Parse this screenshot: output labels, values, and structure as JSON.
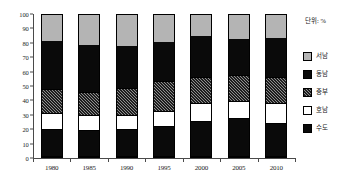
{
  "unit_note": "단위: %",
  "legend": {
    "items": [
      {
        "label": "서남",
        "swatch": "gray"
      },
      {
        "label": "동남",
        "swatch": "solid-black"
      },
      {
        "label": "중부",
        "swatch": "hatch"
      },
      {
        "label": "호남",
        "swatch": "white"
      },
      {
        "label": "수도",
        "swatch": "solid-black"
      }
    ]
  },
  "chart_data": {
    "type": "bar",
    "subtype": "stacked-100",
    "title": "",
    "xlabel": "",
    "ylabel": "",
    "ylim": [
      0,
      100
    ],
    "ytick_step": 10,
    "yticks": [
      0,
      10,
      20,
      30,
      40,
      50,
      60,
      70,
      80,
      90,
      100
    ],
    "grid": false,
    "legend_position": "right",
    "categories": [
      "1980",
      "1985",
      "1990",
      "1995",
      "2000",
      "2005",
      "2010"
    ],
    "series": [
      {
        "name": "수도",
        "swatch": "solid-black",
        "values": [
          19,
          18,
          19,
          21,
          25,
          27,
          23
        ]
      },
      {
        "name": "호남",
        "swatch": "white",
        "values": [
          11,
          11,
          10,
          11,
          12,
          12,
          14
        ]
      },
      {
        "name": "중부",
        "swatch": "hatch",
        "values": [
          17,
          16,
          19,
          21,
          19,
          18,
          19
        ]
      },
      {
        "name": "동남",
        "swatch": "solid-black",
        "values": [
          35,
          34,
          30,
          28,
          29,
          26,
          28
        ]
      },
      {
        "name": "서남",
        "swatch": "gray",
        "values": [
          18,
          21,
          22,
          19,
          15,
          17,
          16
        ]
      }
    ],
    "cumulative_tops": {
      "1980": [
        19,
        30,
        47,
        82,
        100
      ],
      "1985": [
        18,
        29,
        45,
        79,
        100
      ],
      "1990": [
        19,
        29,
        48,
        78,
        100
      ],
      "1995": [
        21,
        32,
        53,
        81,
        100
      ],
      "2000": [
        25,
        37,
        56,
        85,
        100
      ],
      "2005": [
        27,
        39,
        57,
        83,
        100
      ],
      "2010": [
        23,
        37,
        56,
        84,
        100
      ]
    }
  }
}
